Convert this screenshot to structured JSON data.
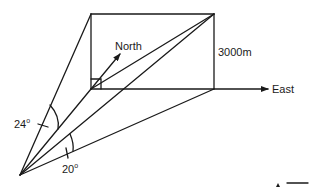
{
  "diagram": {
    "type": "3d-geometry-elevation",
    "labels": {
      "north": "North",
      "east": "East",
      "height": "3000m",
      "angle_left": "24",
      "angle_right": "20",
      "degree_symbol": "o"
    },
    "points": {
      "observer": [
        20,
        175
      ],
      "base_near": [
        91,
        89
      ],
      "top_near": [
        91,
        14
      ],
      "top_far": [
        214,
        14
      ],
      "base_far": [
        214,
        89
      ],
      "east_arrow_tip": [
        268,
        89
      ],
      "north_arrow_tip": [
        120,
        51
      ]
    },
    "colors": {
      "line": "#1a1a1a",
      "background": "#ffffff"
    }
  }
}
